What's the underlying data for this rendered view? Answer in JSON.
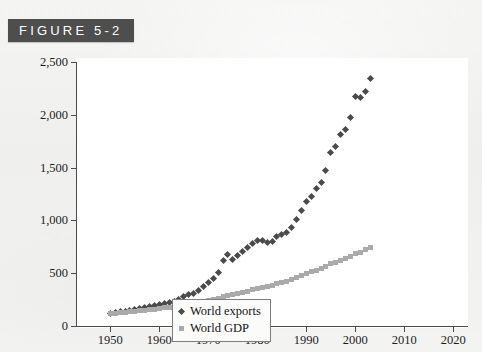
{
  "figure": {
    "tag_label": "FIGURE 5-2"
  },
  "chart_data": {
    "type": "scatter",
    "title": "",
    "xlabel": "",
    "ylabel": "",
    "xlim": [
      1943,
      2023
    ],
    "ylim": [
      0,
      2500
    ],
    "grid": false,
    "legend_position": "bottom-center",
    "xticks": [
      1950,
      1960,
      1970,
      1980,
      1990,
      2000,
      2010,
      2020
    ],
    "xtick_labels": [
      "1950",
      "1960",
      "1970",
      "1980",
      "1990",
      "2000",
      "2010",
      "2020"
    ],
    "yticks": [
      0,
      500,
      1000,
      1500,
      2000,
      2500
    ],
    "ytick_labels": [
      "0",
      "500",
      "1,000",
      "1,500",
      "2,000",
      "2,500"
    ],
    "x": [
      1950,
      1951,
      1952,
      1953,
      1954,
      1955,
      1956,
      1957,
      1958,
      1959,
      1960,
      1961,
      1962,
      1963,
      1964,
      1965,
      1966,
      1967,
      1968,
      1969,
      1970,
      1971,
      1972,
      1973,
      1974,
      1975,
      1976,
      1977,
      1978,
      1979,
      1980,
      1981,
      1982,
      1983,
      1984,
      1985,
      1986,
      1987,
      1988,
      1989,
      1990,
      1991,
      1992,
      1993,
      1994,
      1995,
      1996,
      1997,
      1998,
      1999,
      2000,
      2001,
      2002,
      2003
    ],
    "series": [
      {
        "name": "World exports",
        "marker": "diamond",
        "color": "#4b4b4b",
        "values": [
          120,
          130,
          135,
          140,
          148,
          158,
          168,
          178,
          180,
          190,
          205,
          212,
          222,
          235,
          255,
          275,
          295,
          310,
          340,
          375,
          415,
          450,
          510,
          625,
          680,
          630,
          670,
          705,
          740,
          780,
          805,
          810,
          790,
          800,
          845,
          865,
          885,
          930,
          1010,
          1090,
          1180,
          1225,
          1300,
          1355,
          1470,
          1640,
          1700,
          1810,
          1860,
          1975,
          2175,
          2160,
          2225,
          2345
        ]
      },
      {
        "name": "World GDP",
        "marker": "square",
        "color": "#aaaaaa",
        "values": [
          115,
          120,
          124,
          128,
          133,
          139,
          145,
          150,
          154,
          160,
          166,
          172,
          178,
          185,
          192,
          200,
          208,
          214,
          222,
          232,
          242,
          250,
          262,
          275,
          288,
          300,
          310,
          320,
          330,
          342,
          356,
          366,
          374,
          384,
          398,
          410,
          424,
          440,
          460,
          478,
          498,
          512,
          528,
          542,
          562,
          588,
          602,
          620,
          638,
          658,
          682,
          698,
          720,
          748
        ]
      }
    ],
    "legend": [
      {
        "label": "World exports",
        "marker": "diamond",
        "color": "#4b4b4b"
      },
      {
        "label": "World GDP",
        "marker": "square",
        "color": "#aaaaaa"
      }
    ]
  }
}
